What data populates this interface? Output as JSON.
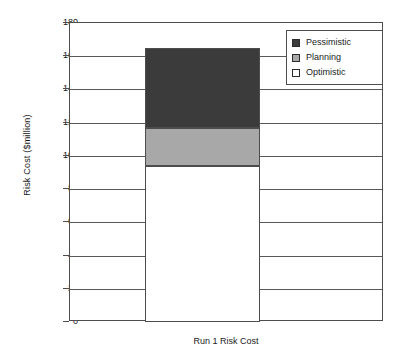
{
  "chart_data": {
    "type": "bar",
    "subtype": "stacked-bar",
    "title": "",
    "xlabel": "Run 1 Risk Cost",
    "ylabel": "Risk Cost  ($million)",
    "categories": [
      "Run 1 Risk Cost"
    ],
    "series": [
      {
        "name": "Optimistic",
        "values": [
          94
        ],
        "color": "#ffffff",
        "segment_from": 0,
        "segment_to": 94
      },
      {
        "name": "Planning",
        "values": [
          23
        ],
        "color": "#a8a8a8",
        "segment_from": 94,
        "segment_to": 117
      },
      {
        "name": "Pessimistic",
        "values": [
          48
        ],
        "color": "#3b3b3b",
        "segment_from": 117,
        "segment_to": 165
      }
    ],
    "stack_total": 165,
    "ylim": [
      0,
      180
    ],
    "yticks": [
      0,
      20,
      40,
      60,
      80,
      100,
      120,
      140,
      160,
      180
    ],
    "ytick_labels": [
      "0",
      "20",
      "40",
      "60",
      "80",
      "100",
      "120",
      "140",
      "160",
      "180"
    ],
    "grid": true,
    "grid_axis": "y",
    "legend_position": "top-right",
    "legend_entries": [
      "Pessimistic",
      "Planning",
      "Optimistic"
    ]
  },
  "axis": {
    "y_title": "Risk Cost  ($million)",
    "x_title": "Run 1 Risk Cost",
    "ticks": [
      {
        "label": "180",
        "value": 180
      },
      {
        "label": "160",
        "value": 160
      },
      {
        "label": "140",
        "value": 140
      },
      {
        "label": "120",
        "value": 120
      },
      {
        "label": "100",
        "value": 100
      },
      {
        "label": "80",
        "value": 80
      },
      {
        "label": "60",
        "value": 60
      },
      {
        "label": "40",
        "value": 40
      },
      {
        "label": "20",
        "value": 20
      },
      {
        "label": "0",
        "value": 0
      }
    ]
  },
  "legend": {
    "items": [
      {
        "label": "Pessimistic",
        "color": "#3b3b3b"
      },
      {
        "label": "Planning",
        "color": "#a8a8a8"
      },
      {
        "label": "Optimistic",
        "color": "#ffffff"
      }
    ]
  }
}
